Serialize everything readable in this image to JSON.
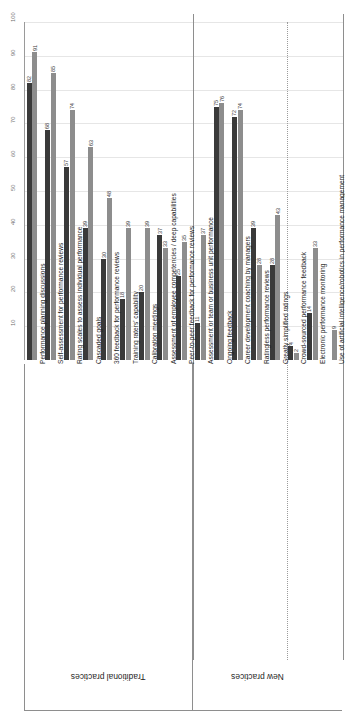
{
  "chart_data": {
    "type": "bar",
    "orientation": "vertical-rotated",
    "title": "",
    "xlabel": "",
    "ylabel": "",
    "ylim": [
      0,
      100
    ],
    "grid": true,
    "legend_position": "none",
    "ticks": [
      "100",
      "90",
      "80",
      "70",
      "60",
      "50",
      "40",
      "30",
      "20",
      "10"
    ],
    "tick_values": [
      100,
      90,
      80,
      70,
      60,
      50,
      40,
      30,
      20,
      10
    ],
    "groups": [
      {
        "name": "Traditional practices",
        "count": 9
      },
      {
        "name": "New practices",
        "count": 7
      }
    ],
    "categories": [
      "Performance planning discussions",
      "Self-assessment for performance reviews",
      "Rating scales to assess individual performance",
      "Cascaded goals",
      "360 feedback for performance reviews",
      "Training raters' capability",
      "Calibration meetings",
      "Assessment of employee competencies / deep capabilities",
      "Peer-to-peer feedback for performance reviews",
      "Assessment or team or business unit performance",
      "Ongoing feedback",
      "Career development coaching by managers",
      "Ratingless performance reviews",
      "Greatly simplified ratings",
      "Crowd-sourced performance feedback",
      "Electronic performance monitoring",
      "Use of artificial intelligence/robotics in performance management"
    ],
    "series": [
      {
        "name": "dark",
        "color": "#3a3a3a",
        "values": [
          82,
          68,
          57,
          39,
          30,
          18,
          20,
          37,
          25,
          11,
          75,
          72,
          39,
          28,
          4,
          14,
          0
        ]
      },
      {
        "name": "light",
        "color": "#8d8d8d",
        "values": [
          91,
          85,
          74,
          63,
          48,
          39,
          39,
          33,
          35,
          37,
          76,
          74,
          28,
          43,
          2,
          33,
          9
        ]
      }
    ],
    "point_labels": {
      "dark": [
        "82",
        "68",
        "57",
        "39",
        "30",
        "18",
        "20",
        "37",
        "25",
        "11",
        "75",
        "72",
        "39",
        "28",
        "4",
        "14",
        ""
      ],
      "light": [
        "91",
        "85",
        "74",
        "63",
        "48",
        "39",
        "39",
        "33",
        "35",
        "37",
        "76",
        "74",
        "28",
        "43",
        "2",
        "33",
        "9"
      ]
    }
  }
}
